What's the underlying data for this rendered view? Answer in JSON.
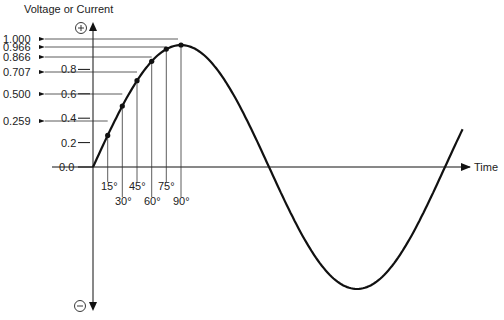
{
  "diagram": {
    "y_axis_title": "Voltage or Current",
    "x_axis_title": "Time",
    "positive_symbol": "+",
    "negative_symbol": "−",
    "y_ticks": [
      {
        "label": "0.0",
        "value": 0.0
      },
      {
        "label": "0.2",
        "value": 0.2
      },
      {
        "label": "0.4",
        "value": 0.4
      },
      {
        "label": "0.6",
        "value": 0.6
      },
      {
        "label": "0.8",
        "value": 0.8
      }
    ],
    "sample_points": [
      {
        "angle_label": "15°",
        "angle": 15,
        "value_label": "0.259",
        "value": 0.259
      },
      {
        "angle_label": "30°",
        "angle": 30,
        "value_label": "0.500",
        "value": 0.5
      },
      {
        "angle_label": "45°",
        "angle": 45,
        "value_label": "0.707",
        "value": 0.707
      },
      {
        "angle_label": "60°",
        "angle": 60,
        "value_label": "0.866",
        "value": 0.866
      },
      {
        "angle_label": "75°",
        "angle": 75,
        "value_label": "0.966",
        "value": 0.966
      },
      {
        "angle_label": "90°",
        "angle": 90,
        "value_label": "1.000",
        "value": 1.0
      }
    ],
    "curve": "sine wave from 0° to ~375°",
    "colors": {
      "line": "#111111",
      "grid": "#444444",
      "background": "#ffffff"
    }
  }
}
